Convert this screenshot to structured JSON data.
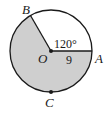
{
  "diagram": {
    "type": "circle-sector",
    "center_label": "O",
    "points": {
      "A": "A",
      "B": "B",
      "C": "C"
    },
    "angle_label": "120°",
    "radius_label": "9",
    "colors": {
      "shaded": "#cfcfcf",
      "stroke": "#1a1a1a",
      "background": "#ffffff"
    }
  }
}
